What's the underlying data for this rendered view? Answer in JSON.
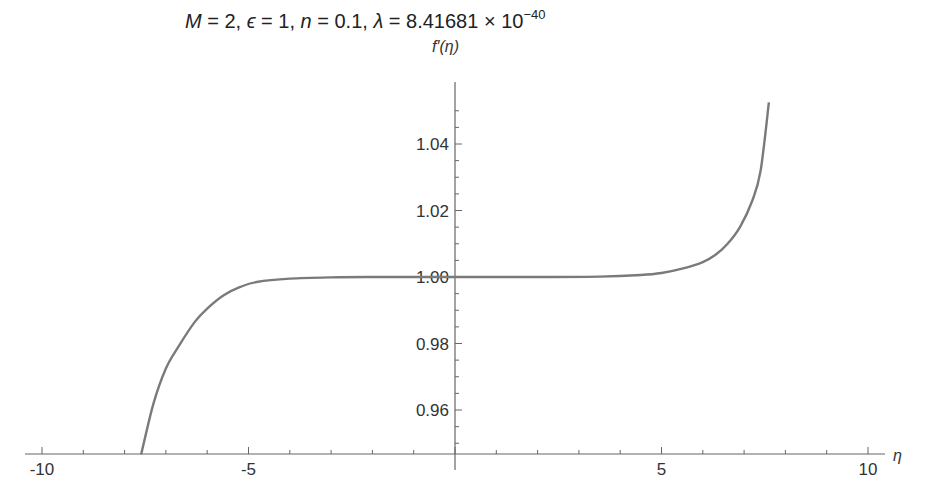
{
  "chart_data": {
    "type": "line",
    "title_parts": {
      "M": "M",
      "M_eq": " = 2,",
      "eps": " ϵ",
      "eps_eq": " = 1,",
      "n": " n",
      "n_eq": " = 0.1,",
      "lambda": " λ",
      "lambda_eq": " = 8.41681 × 10",
      "exponent": "−40"
    },
    "xlabel": "η",
    "ylabel": "f′(η)",
    "xlim": [
      -10.5,
      10.5
    ],
    "ylim": [
      0.9466,
      1.057
    ],
    "x_ticks": [
      -10,
      -5,
      0,
      5,
      10
    ],
    "x_tick_labels": [
      "-10",
      "-5",
      "",
      "5",
      "10"
    ],
    "y_ticks": [
      0.96,
      0.98,
      1.0,
      1.02,
      1.04
    ],
    "y_tick_labels": [
      "0.96",
      "0.98",
      "1.00",
      "1.02",
      "1.04"
    ],
    "grid": false,
    "legend": null,
    "series": [
      {
        "name": "f'(η)",
        "color": "#7a7a7a",
        "x": [
          -7.6,
          -7.3,
          -7.0,
          -6.7,
          -6.3,
          -6.0,
          -5.6,
          -5.2,
          -4.8,
          -4.0,
          -3.0,
          -2.0,
          0.0,
          2.0,
          3.5,
          4.5,
          5.0,
          5.5,
          6.0,
          6.3,
          6.6,
          6.9,
          7.2,
          7.4,
          7.6
        ],
        "values": [
          0.9466,
          0.962,
          0.9725,
          0.979,
          0.9865,
          0.9905,
          0.9945,
          0.997,
          0.9985,
          0.9995,
          0.9999,
          1.0,
          1.0,
          1.0,
          1.0001,
          1.0006,
          1.0012,
          1.0025,
          1.0045,
          1.0066,
          1.01,
          1.015,
          1.023,
          1.032,
          1.0525
        ]
      }
    ]
  }
}
